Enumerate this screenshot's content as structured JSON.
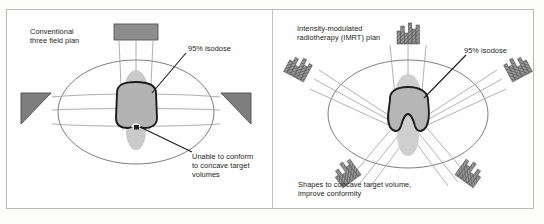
{
  "figure": {
    "type": "medical-radiotherapy-comparison-diagram",
    "panels": [
      {
        "id": "conventional",
        "title": "Conventional\nthree field plan",
        "isodose_label": "95% isodose",
        "caption": "Unable to conform\nto concave target\nvolumes",
        "beam_count": 3,
        "beam_type": "uniform-intensity-with-wedges",
        "target_shape": "convex-rounded-square",
        "conforms_to_concavity": false,
        "beams": [
          {
            "name": "anterior-beam",
            "angle_deg": 0,
            "profile": "flat-uniform"
          },
          {
            "name": "left-lateral-wedge-beam",
            "angle_deg": 270,
            "profile": "wedge"
          },
          {
            "name": "right-lateral-wedge-beam",
            "angle_deg": 90,
            "profile": "wedge"
          }
        ]
      },
      {
        "id": "imrt",
        "title": "Intensity-modulated\nradiotherapy (IMRT) plan",
        "isodose_label": "95% isodose",
        "caption": "Shapes to concave target volume,\nimprove conformity",
        "beam_count": 5,
        "beam_type": "modulated-intensity-profile",
        "target_shape": "concave-notched",
        "conforms_to_concavity": true,
        "beams": [
          {
            "name": "anterior-beam",
            "angle_deg": 0,
            "profile": "modulated-histogram"
          },
          {
            "name": "left-anterior-oblique-beam",
            "angle_deg": 300,
            "profile": "modulated-histogram"
          },
          {
            "name": "right-anterior-oblique-beam",
            "angle_deg": 60,
            "profile": "modulated-histogram"
          },
          {
            "name": "left-posterior-oblique-beam",
            "angle_deg": 215,
            "profile": "modulated-histogram"
          },
          {
            "name": "right-posterior-oblique-beam",
            "angle_deg": 145,
            "profile": "modulated-histogram"
          }
        ]
      }
    ],
    "colors": {
      "outline": "#231f20",
      "body_contour": "#6d6d6d",
      "beam_block": "#7a7a7a",
      "organ_fill": "#c6c6c6",
      "target_fill": "#b0b0b0",
      "frame": "#b9b9b9",
      "background": "#fefefe"
    }
  }
}
